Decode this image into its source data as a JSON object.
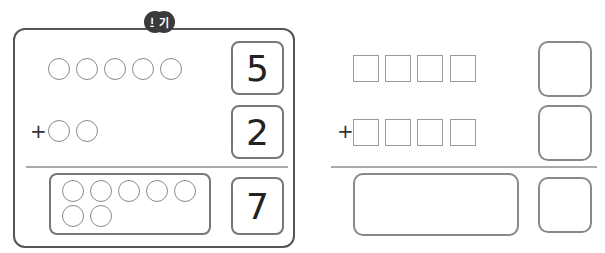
{
  "example": {
    "badge": [
      "보",
      "기"
    ],
    "row1": {
      "circles": 5,
      "number": "5"
    },
    "row2": {
      "sign": "+",
      "circles": 2,
      "number": "2"
    },
    "result": {
      "circles": 7,
      "number": "7"
    }
  },
  "exercise": {
    "row1": {
      "squares": 4,
      "answer": ""
    },
    "row2": {
      "sign": "+",
      "squares": 4,
      "answer": ""
    },
    "result": {
      "answer": ""
    }
  }
}
